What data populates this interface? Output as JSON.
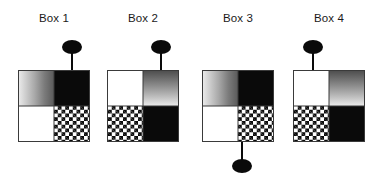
{
  "figure": {
    "type": "diagram",
    "background_color": "#ffffff",
    "fill_legend": {
      "white": "#ffffff",
      "black": "#0a0a0a",
      "gradient": "#5a5a5a",
      "checkered": "#0a0a0a",
      "border": "#3a3a3a",
      "pin": "#0a0a0a"
    },
    "boxes": [
      {
        "label": "Box 1",
        "quadrants": {
          "top_left": "gradient-horizontal",
          "top_right": "black",
          "bottom_left": "white",
          "bottom_right": "checkered"
        },
        "pin": {
          "position": "top",
          "quadrant": "top-right",
          "offset_px": 52
        }
      },
      {
        "label": "Box 2",
        "quadrants": {
          "top_left": "white",
          "top_right": "gradient-vertical",
          "bottom_left": "checkered",
          "bottom_right": "black"
        },
        "pin": {
          "position": "top",
          "quadrant": "top-right",
          "offset_px": 52
        }
      },
      {
        "label": "Box 3",
        "quadrants": {
          "top_left": "gradient-horizontal",
          "top_right": "black",
          "bottom_left": "white",
          "bottom_right": "checkered"
        },
        "pin": {
          "position": "bottom",
          "quadrant": "bottom-right",
          "offset_px": 38
        }
      },
      {
        "label": "Box 4",
        "quadrants": {
          "top_left": "white",
          "top_right": "gradient-vertical",
          "bottom_left": "checkered",
          "bottom_right": "black"
        },
        "pin": {
          "position": "top",
          "quadrant": "top-left",
          "offset_px": 26
        }
      }
    ]
  }
}
